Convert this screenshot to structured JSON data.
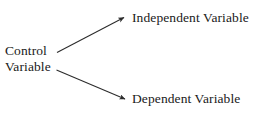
{
  "diagram": {
    "type": "variable-relationship-diagram",
    "background_color": "#ffffff",
    "line_color": "#2b2b2b",
    "text_color": "#1a1a1a",
    "nodes": {
      "control": {
        "line1": "Control",
        "line2": "Variable"
      },
      "independent": {
        "label": "Independent Variable"
      },
      "dependent": {
        "label": "Dependent Variable"
      }
    },
    "arrows": [
      {
        "name": "control-to-independent",
        "from": "Control Variable",
        "to": "Independent Variable",
        "direction": "up-right"
      },
      {
        "name": "control-to-dependent",
        "from": "Control Variable",
        "to": "Dependent Variable",
        "direction": "down-right"
      }
    ]
  }
}
